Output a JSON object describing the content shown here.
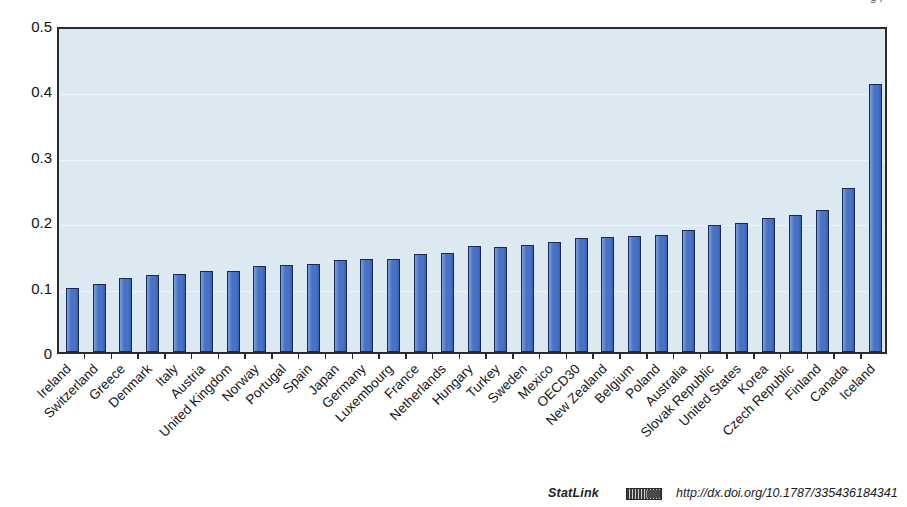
{
  "top_fragment": "g   ,",
  "chart_data": {
    "type": "bar",
    "title": "",
    "subtitle": "",
    "xlabel": "",
    "ylabel": "",
    "ylim": [
      0,
      0.5
    ],
    "ytick_labels": [
      "0.5",
      "0.4",
      "0.3",
      "0.2",
      "0.1",
      "0"
    ],
    "ytick_values": [
      0.5,
      0.4,
      0.3,
      0.2,
      0.1,
      0
    ],
    "grid": true,
    "legend": "none",
    "bar_fill_color": "#4a72c4",
    "bar_border_color": "#1b2a52",
    "plot_background_color": "#dce9f2",
    "categories": [
      "Ireland",
      "Switzerland",
      "Greece",
      "Denmark",
      "Italy",
      "Austria",
      "United Kingdom",
      "Norway",
      "Portugal",
      "Spain",
      "Japan",
      "Germany",
      "Luxembourg",
      "France",
      "Netherlands",
      "Hungary",
      "Turkey",
      "Sweden",
      "Mexico",
      "OECD30",
      "New Zealand",
      "Belgium",
      "Poland",
      "Australia",
      "Slovak Republic",
      "United States",
      "Korea",
      "Czech Republic",
      "Finland",
      "Canada",
      "Iceland"
    ],
    "values": [
      0.098,
      0.105,
      0.114,
      0.118,
      0.12,
      0.124,
      0.125,
      0.133,
      0.134,
      0.135,
      0.142,
      0.143,
      0.143,
      0.151,
      0.153,
      0.163,
      0.162,
      0.164,
      0.169,
      0.176,
      0.177,
      0.178,
      0.18,
      0.188,
      0.196,
      0.199,
      0.206,
      0.211,
      0.218,
      0.252,
      0.412
    ]
  },
  "footer": {
    "statlink_label": "StatLink",
    "statlink_icon": "statlink-2d-barcode-icon",
    "url": "http://dx.doi.org/10.1787/335436184341"
  }
}
